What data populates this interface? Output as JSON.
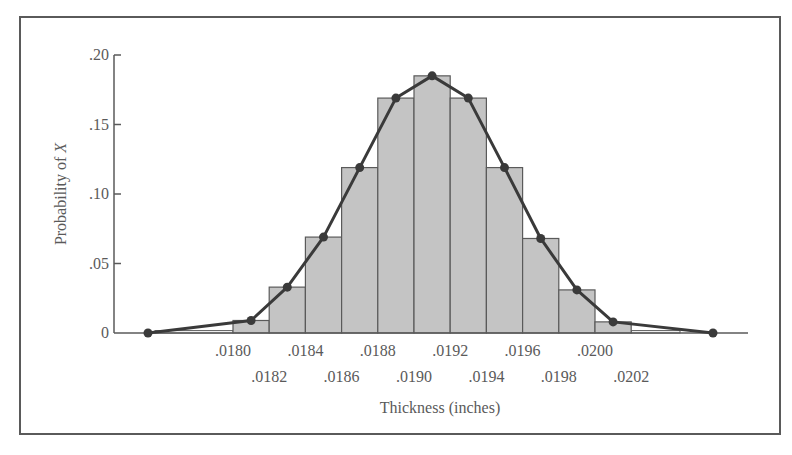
{
  "chart_data": {
    "type": "bar",
    "subtype": "histogram with frequency polygon",
    "title": "",
    "xlabel": "Thickness (inches)",
    "ylabel_prefix": "Probability of ",
    "ylabel_var": "X",
    "ylim": [
      0,
      0.2
    ],
    "y_ticks": [
      {
        "value": 0,
        "label": "0"
      },
      {
        "value": 0.05,
        "label": ".05"
      },
      {
        "value": 0.1,
        "label": ".10"
      },
      {
        "value": 0.15,
        "label": ".15"
      },
      {
        "value": 0.2,
        "label": ".20"
      }
    ],
    "x_tick_labels_upper": [
      ".0180",
      ".0184",
      ".0188",
      ".0192",
      ".0196",
      ".0200"
    ],
    "x_tick_labels_lower": [
      ".0182",
      ".0186",
      ".0190",
      ".0194",
      ".0198",
      ".0202"
    ],
    "bin_edges": [
      0.018,
      0.0182,
      0.0184,
      0.0186,
      0.0188,
      0.019,
      0.0192,
      0.0194,
      0.0196,
      0.0198,
      0.02,
      0.0202
    ],
    "categories": [
      ".0180-.0182",
      ".0182-.0184",
      ".0184-.0186",
      ".0186-.0188",
      ".0188-.0190",
      ".0190-.0192",
      ".0192-.0194",
      ".0194-.0196",
      ".0196-.0198",
      ".0198-.0200",
      ".0200-.0202"
    ],
    "values": [
      0.009,
      0.033,
      0.069,
      0.119,
      0.169,
      0.185,
      0.169,
      0.119,
      0.068,
      0.031,
      0.008
    ],
    "tail_bars": [
      {
        "range": "< .0180",
        "value": 0.001
      },
      {
        "range": "> .0202",
        "value": 0.001
      }
    ],
    "series": [
      {
        "name": "Histogram",
        "style": "gray bars",
        "values": [
          0.009,
          0.033,
          0.069,
          0.119,
          0.169,
          0.185,
          0.169,
          0.119,
          0.068,
          0.031,
          0.008
        ]
      },
      {
        "name": "Frequency polygon",
        "style": "dark line with dot markers",
        "x": [
          0.0177,
          0.0181,
          0.0183,
          0.0185,
          0.0187,
          0.0189,
          0.0191,
          0.0193,
          0.0195,
          0.0197,
          0.0199,
          0.0201,
          0.0205
        ],
        "values": [
          0,
          0.009,
          0.033,
          0.069,
          0.119,
          0.169,
          0.185,
          0.169,
          0.119,
          0.068,
          0.031,
          0.008,
          0
        ]
      }
    ],
    "grid": false,
    "legend": null,
    "colors": {
      "bar_fill": "#c4c4c4",
      "bar_stroke": "#5a5a5a",
      "line": "#3a3a3a",
      "axis": "#5a5a5a"
    }
  }
}
